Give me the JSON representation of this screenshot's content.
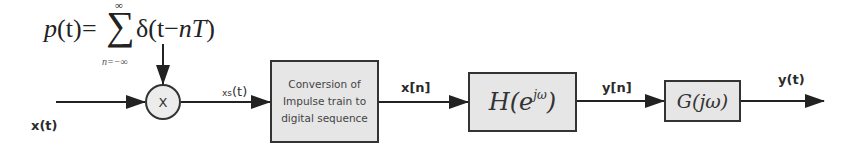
{
  "diagram": {
    "formula": {
      "lhs": "p(t)",
      "equals": "=",
      "sum_symbol": "∑",
      "sum_upper": "∞",
      "sum_lower": "n=−∞",
      "term": "δ(t−nT)"
    },
    "signals": {
      "input": "x(t)",
      "sampled": "xs(t)",
      "discrete_in": "x[n]",
      "discrete_out": "y[n]",
      "output": "y(t)"
    },
    "blocks": {
      "multiplier": "X",
      "converter": "Conversion of Impulse train to digital sequence",
      "discrete_filter_base": "H(e",
      "discrete_filter_sup": "jω",
      "discrete_filter_close": ")",
      "reconstruction_filter": "G(jω)"
    },
    "colors": {
      "line": "#222222",
      "block_fill": "#e6e6e6",
      "block_border": "#333333"
    }
  }
}
